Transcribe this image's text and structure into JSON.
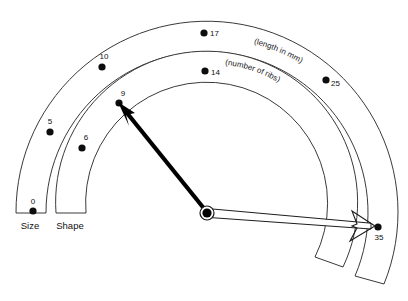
{
  "figure": {
    "type": "dial-gauge-diagram",
    "center": {
      "x": 207,
      "y": 213
    },
    "background_color": "#ffffff",
    "line_color": "#3a3a3a",
    "dot_color": "#0d0d0d"
  },
  "axes": [
    {
      "id": "size",
      "name": "Size",
      "unit_caption": "(length in mm)",
      "inner_radius": 161,
      "outer_radius": 191,
      "name_label": {
        "x": 28,
        "y": 228
      },
      "unit_caption_anchor": {
        "x": 302,
        "y": 63
      },
      "ticks": [
        {
          "value": "0",
          "dot": {
            "x": 33,
            "y": 211
          },
          "label": {
            "x": 33,
            "y": 203
          }
        },
        {
          "value": "5",
          "dot": {
            "x": 50,
            "y": 132
          },
          "label": {
            "x": 50,
            "y": 124
          }
        },
        {
          "value": "10",
          "dot": {
            "x": 102,
            "y": 67
          },
          "label": {
            "x": 104,
            "y": 59
          }
        },
        {
          "value": "17",
          "dot": {
            "x": 204,
            "y": 33
          },
          "label": {
            "x": 214,
            "y": 36
          }
        },
        {
          "value": "25",
          "dot": {
            "x": 326,
            "y": 80
          },
          "label": {
            "x": 335,
            "y": 86
          }
        },
        {
          "value": "35",
          "dot": {
            "x": 378,
            "y": 227
          },
          "label": {
            "x": 380,
            "y": 239
          }
        }
      ]
    },
    {
      "id": "shape",
      "name": "Shape",
      "unit_caption": "(number of ribs)",
      "inner_radius": 121,
      "outer_radius": 152,
      "name_label": {
        "x": 68,
        "y": 228
      },
      "unit_caption_anchor": {
        "x": 243,
        "y": 81
      },
      "ticks": [
        {
          "value": "6",
          "dot": {
            "x": 82,
            "y": 148
          },
          "label": {
            "x": 86,
            "y": 140
          }
        },
        {
          "value": "9",
          "dot": {
            "x": 119,
            "y": 103
          },
          "label": {
            "x": 123,
            "y": 96
          }
        },
        {
          "value": "14",
          "dot": {
            "x": 205,
            "y": 71
          },
          "label": {
            "x": 215,
            "y": 75
          }
        }
      ]
    }
  ],
  "needles": [
    {
      "id": "shape-needle",
      "style": "solid-black",
      "points_to_value": "9",
      "tip": {
        "x": 121,
        "y": 106
      }
    },
    {
      "id": "size-needle",
      "style": "hollow-outline",
      "points_to_value": "35",
      "tip": {
        "x": 374,
        "y": 226
      }
    }
  ],
  "pivot": {
    "x": 207,
    "y": 213,
    "outer_r": 7,
    "inner_r": 4.5
  }
}
